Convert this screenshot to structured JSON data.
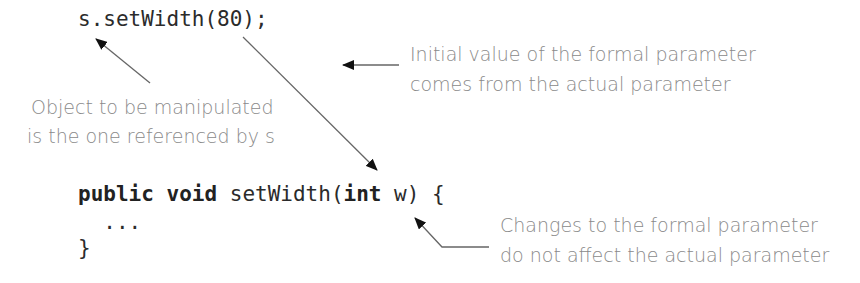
{
  "code": {
    "call_line": "s.setWidth(80);",
    "decl": {
      "kw_public": "public",
      "kw_void": "void",
      "method": " setWidth(",
      "kw_int": "int",
      "param": " w) {"
    },
    "body_line": "  ...",
    "close_line": "}"
  },
  "annotations": {
    "object": {
      "line1": "Object to be manipulated",
      "line2": "is the one referenced by s"
    },
    "initial_value": {
      "line1": "Initial value of the formal parameter",
      "line2": "comes from the actual parameter"
    },
    "changes": {
      "line1": "Changes to the formal parameter",
      "line2": "do not affect the actual parameter"
    }
  },
  "colors": {
    "code": "#2b2b2b",
    "annotation": "#8a8a8a",
    "arrow": "#555555",
    "arrowhead": "#111111"
  }
}
